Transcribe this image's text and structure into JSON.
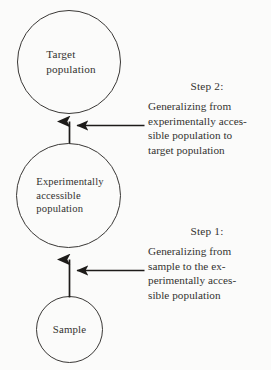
{
  "figure": {
    "background_color": "#fbfbfa",
    "stroke_color": "#3a3836",
    "text_color": "#333230"
  },
  "nodes": [
    {
      "id": "target-population",
      "label": "Target\npopulation",
      "shape": "circle"
    },
    {
      "id": "experimentally-accessible-population",
      "label": "Experimentally\naccessible\npopulation",
      "shape": "circle"
    },
    {
      "id": "sample",
      "label": "Sample",
      "shape": "circle"
    }
  ],
  "annotations": [
    {
      "id": "step-2",
      "heading": "Step 2:",
      "body": "Generalizing from\nexperimentally acces-\nsible population to\ntarget population"
    },
    {
      "id": "step-1",
      "heading": "Step 1:",
      "body": "Generalizing from\nsample to the ex-\nperimentally acces-\nsible population"
    }
  ],
  "arrows": [
    {
      "id": "arrow-accessible-to-target",
      "direction": "up",
      "from": "experimentally-accessible-population",
      "to": "target-population"
    },
    {
      "id": "arrow-step2-pointer",
      "direction": "left",
      "from": "step-2",
      "to": "arrow-accessible-to-target"
    },
    {
      "id": "arrow-sample-to-accessible",
      "direction": "up",
      "from": "sample",
      "to": "experimentally-accessible-population"
    },
    {
      "id": "arrow-step1-pointer",
      "direction": "left",
      "from": "step-1",
      "to": "arrow-sample-to-accessible"
    }
  ]
}
